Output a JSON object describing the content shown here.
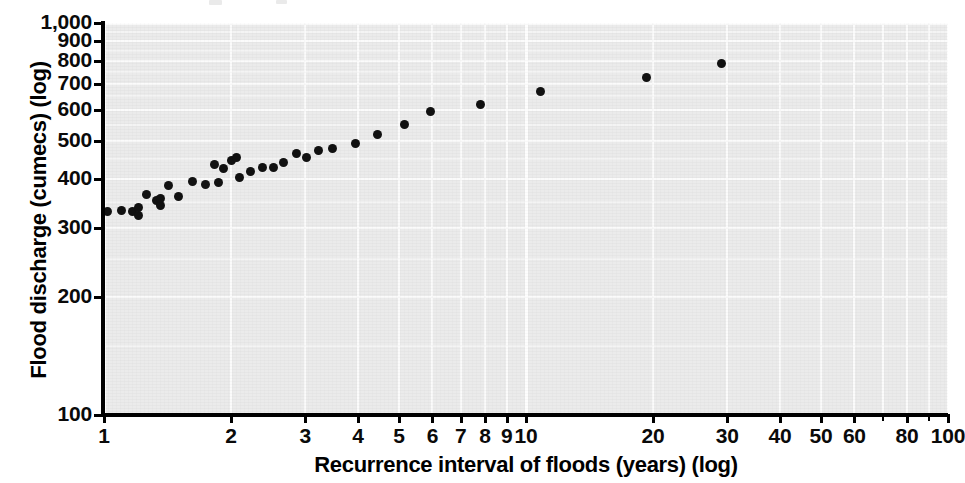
{
  "chart_data": {
    "type": "scatter",
    "title": "",
    "xlabel": "Recurrence interval of floods (years) (log)",
    "ylabel": "Flood discharge (cumecs) (log)",
    "xscale": "log",
    "yscale": "log",
    "xlim": [
      1,
      100
    ],
    "ylim": [
      100,
      1000
    ],
    "grid": true,
    "legend": "none",
    "marker": "filled-circle",
    "marker_color": "#111111",
    "plot_background": "#ebebeb",
    "gridline_color": "#fbfbfb",
    "x_ticklabels": [
      "1",
      "2",
      "3",
      "4",
      "5",
      "6",
      "7",
      "8",
      "9",
      "10",
      "20",
      "30",
      "40",
      "50",
      "60",
      "80",
      "100"
    ],
    "x_tickvalues": [
      1,
      2,
      3,
      4,
      5,
      6,
      7,
      8,
      9,
      10,
      20,
      30,
      40,
      50,
      60,
      80,
      100
    ],
    "x_unlabeled_tickvalues": [
      70,
      90
    ],
    "y_ticklabels": [
      "100",
      "200",
      "300",
      "400",
      "500",
      "600",
      "700",
      "800",
      "900",
      "1,000"
    ],
    "y_tickvalues": [
      100,
      200,
      300,
      400,
      500,
      600,
      700,
      800,
      900,
      1000
    ],
    "points": [
      {
        "x": 1.02,
        "y": 331
      },
      {
        "x": 1.1,
        "y": 333
      },
      {
        "x": 1.17,
        "y": 331
      },
      {
        "x": 1.21,
        "y": 323
      },
      {
        "x": 1.21,
        "y": 338
      },
      {
        "x": 1.26,
        "y": 365
      },
      {
        "x": 1.33,
        "y": 352
      },
      {
        "x": 1.36,
        "y": 342
      },
      {
        "x": 1.36,
        "y": 356
      },
      {
        "x": 1.42,
        "y": 386
      },
      {
        "x": 1.5,
        "y": 360
      },
      {
        "x": 1.62,
        "y": 393
      },
      {
        "x": 1.74,
        "y": 388
      },
      {
        "x": 1.83,
        "y": 435
      },
      {
        "x": 1.87,
        "y": 392
      },
      {
        "x": 1.92,
        "y": 425
      },
      {
        "x": 2.0,
        "y": 445
      },
      {
        "x": 2.06,
        "y": 455
      },
      {
        "x": 2.1,
        "y": 404
      },
      {
        "x": 2.22,
        "y": 418
      },
      {
        "x": 2.38,
        "y": 427
      },
      {
        "x": 2.52,
        "y": 428
      },
      {
        "x": 2.66,
        "y": 440
      },
      {
        "x": 2.86,
        "y": 465
      },
      {
        "x": 3.02,
        "y": 455
      },
      {
        "x": 3.22,
        "y": 472
      },
      {
        "x": 3.48,
        "y": 478
      },
      {
        "x": 3.95,
        "y": 492
      },
      {
        "x": 4.45,
        "y": 520
      },
      {
        "x": 5.15,
        "y": 551
      },
      {
        "x": 5.95,
        "y": 595
      },
      {
        "x": 7.8,
        "y": 620
      },
      {
        "x": 10.8,
        "y": 670
      },
      {
        "x": 19.3,
        "y": 725
      },
      {
        "x": 29.0,
        "y": 790
      }
    ]
  },
  "axes": {
    "y_title": "Flood discharge (cumecs) (log)",
    "x_title": "Recurrence interval of floods (years) (log)"
  }
}
